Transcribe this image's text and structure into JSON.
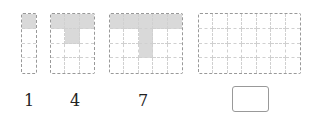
{
  "figures": [
    {
      "id": "fig-1",
      "cols": 1,
      "rows": 4,
      "filled": [
        [
          0,
          0
        ]
      ],
      "label": "1",
      "left": 21,
      "width": 16
    },
    {
      "id": "fig-2",
      "cols": 3,
      "rows": 4,
      "filled": [
        [
          0,
          0
        ],
        [
          0,
          1
        ],
        [
          0,
          2
        ],
        [
          1,
          1
        ]
      ],
      "label": "4",
      "left": 50,
      "width": 45
    },
    {
      "id": "fig-3",
      "cols": 5,
      "rows": 4,
      "filled": [
        [
          0,
          0
        ],
        [
          0,
          1
        ],
        [
          0,
          2
        ],
        [
          0,
          3
        ],
        [
          0,
          4
        ],
        [
          1,
          2
        ],
        [
          2,
          2
        ]
      ],
      "label": "7",
      "left": 109,
      "width": 74
    },
    {
      "id": "fig-4",
      "cols": 7,
      "rows": 4,
      "filled": [],
      "label": "",
      "left": 198,
      "width": 103
    }
  ],
  "labels": {
    "l1": "1",
    "l2": "4",
    "l3": "7"
  },
  "answer": {
    "value": ""
  },
  "colors": {
    "filled": "#d9d9d9",
    "border": "#999999"
  }
}
